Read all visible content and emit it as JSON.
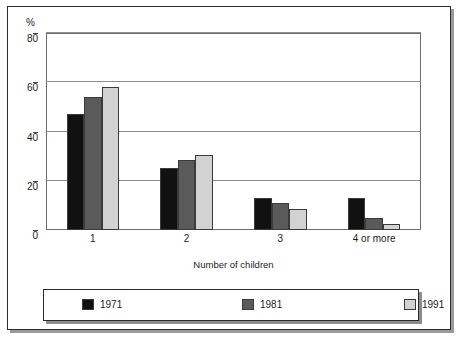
{
  "chart_data": {
    "type": "bar",
    "title": "",
    "subtitle": "",
    "xlabel": "Number of children",
    "ylabel": "%",
    "ylim": [
      0,
      80
    ],
    "yticks": [
      0,
      20,
      40,
      60,
      80
    ],
    "ytick_labels": [
      "0",
      "20",
      "40",
      "60",
      "80"
    ],
    "grid": true,
    "legend_position": "bottom",
    "categories": [
      "1",
      "2",
      "3",
      "4 or more"
    ],
    "series": [
      {
        "name": "1971",
        "color": "#111111",
        "values": [
          47,
          25,
          13,
          13
        ]
      },
      {
        "name": "1981",
        "color": "#5a5a5a",
        "values": [
          54,
          28.5,
          11,
          5
        ]
      },
      {
        "name": "1991",
        "color": "#d2d2d2",
        "values": [
          58,
          30.5,
          8.5,
          2.5
        ]
      }
    ]
  },
  "axis": {
    "y_unit_label": "%",
    "x_title": "Number of children"
  },
  "legend": {
    "entries": [
      {
        "label": "1971",
        "swatch": "#111111"
      },
      {
        "label": "1981",
        "swatch": "#5a5a5a"
      },
      {
        "label": "1991",
        "swatch": "#d2d2d2"
      }
    ]
  },
  "colors": {
    "frame": "#2b2b2b",
    "gridline": "#8e8e8e",
    "plot_border": "#6e6e6e",
    "bar_outline": "#3a3a3a",
    "shadow": "#9a9a9a",
    "text": "#1d1d1d"
  }
}
